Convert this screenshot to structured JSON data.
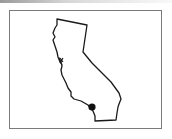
{
  "map": {
    "region": "California",
    "outline_color": "#1a1a1a",
    "frame_color": "#7a7a7a",
    "marker": {
      "label": "location-marker",
      "color": "#111111",
      "x": 92,
      "y": 107,
      "r": 3.6
    }
  }
}
